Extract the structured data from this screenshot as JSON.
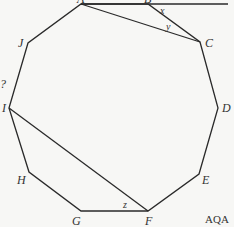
{
  "diagram": {
    "shape": "regular decagon",
    "vertices": [
      {
        "label": "A",
        "x": 81,
        "y": 4,
        "lx": 77,
        "ly": 3
      },
      {
        "label": "B",
        "x": 148,
        "y": 4,
        "lx": 144,
        "ly": 3
      },
      {
        "label": "C",
        "x": 200,
        "y": 42,
        "lx": 205,
        "ly": 47
      },
      {
        "label": "D",
        "x": 218,
        "y": 108,
        "lx": 222,
        "ly": 112
      },
      {
        "label": "E",
        "x": 199,
        "y": 174,
        "lx": 202,
        "ly": 184
      },
      {
        "label": "F",
        "x": 148,
        "y": 211,
        "lx": 145,
        "ly": 225
      },
      {
        "label": "G",
        "x": 81,
        "y": 211,
        "lx": 72,
        "ly": 225
      },
      {
        "label": "H",
        "x": 29,
        "y": 172,
        "lx": 17,
        "ly": 184
      },
      {
        "label": "I",
        "x": 9,
        "y": 108,
        "lx": 2,
        "ly": 112
      },
      {
        "label": "J",
        "x": 28,
        "y": 43,
        "lx": 18,
        "ly": 47
      }
    ],
    "extended_line": {
      "from": "A",
      "through": "B",
      "end_x": 228,
      "end_y": 4
    },
    "diagonals": [
      [
        "A",
        "C"
      ],
      [
        "I",
        "F"
      ]
    ],
    "angles": [
      {
        "label": "x",
        "x": 160,
        "y": 14
      },
      {
        "label": "y",
        "x": 166,
        "y": 30
      },
      {
        "label": "z",
        "x": 123,
        "y": 208
      }
    ],
    "stray_mark": {
      "text": "?",
      "x": 0,
      "y": 88
    },
    "source_label": "AQA"
  }
}
